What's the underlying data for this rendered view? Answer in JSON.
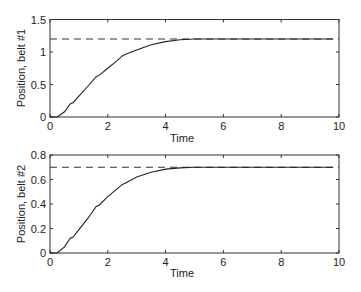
{
  "chart_data": [
    {
      "type": "line",
      "title": "",
      "xlabel": "Time",
      "ylabel": "Position, belt #1",
      "xlim": [
        0,
        10
      ],
      "ylim": [
        0,
        1.5
      ],
      "xticks": [
        "0",
        "2",
        "4",
        "6",
        "8",
        "10"
      ],
      "yticks": [
        "0",
        "0.5",
        "1",
        "1.5"
      ],
      "grid": false,
      "legend": null,
      "series": [
        {
          "name": "response",
          "style": "solid",
          "x": [
            0,
            0.25,
            0.5,
            0.7,
            0.8,
            1.0,
            1.3,
            1.6,
            1.7,
            2.0,
            2.3,
            2.5,
            2.6,
            3.0,
            3.5,
            4.0,
            4.5,
            5.0,
            6.0,
            7.0,
            8.0,
            9.0,
            9.8
          ],
          "y": [
            0,
            0,
            0.08,
            0.2,
            0.22,
            0.32,
            0.47,
            0.62,
            0.64,
            0.75,
            0.86,
            0.94,
            0.96,
            1.03,
            1.11,
            1.16,
            1.19,
            1.2,
            1.2,
            1.2,
            1.2,
            1.2,
            1.2
          ]
        },
        {
          "name": "reference",
          "style": "dashed",
          "x": [
            0,
            10
          ],
          "y": [
            1.2,
            1.2
          ]
        }
      ]
    },
    {
      "type": "line",
      "title": "",
      "xlabel": "Time",
      "ylabel": "Position, belt #2",
      "xlim": [
        0,
        10
      ],
      "ylim": [
        0,
        0.8
      ],
      "xticks": [
        "0",
        "2",
        "4",
        "6",
        "8",
        "10"
      ],
      "yticks": [
        "0",
        "0.2",
        "0.4",
        "0.6",
        "0.8"
      ],
      "grid": false,
      "legend": null,
      "series": [
        {
          "name": "response",
          "style": "solid",
          "x": [
            0,
            0.25,
            0.5,
            0.7,
            0.8,
            1.0,
            1.3,
            1.6,
            1.7,
            2.0,
            2.3,
            2.5,
            2.6,
            3.0,
            3.5,
            4.0,
            4.5,
            5.0,
            6.0,
            7.0,
            8.0,
            9.0,
            9.8
          ],
          "y": [
            0,
            0,
            0.05,
            0.12,
            0.13,
            0.19,
            0.28,
            0.38,
            0.39,
            0.46,
            0.52,
            0.56,
            0.57,
            0.62,
            0.66,
            0.685,
            0.695,
            0.7,
            0.7,
            0.7,
            0.7,
            0.7,
            0.7
          ]
        },
        {
          "name": "reference",
          "style": "dashed",
          "x": [
            0,
            10
          ],
          "y": [
            0.7,
            0.7
          ]
        }
      ]
    }
  ],
  "plots": [
    {
      "ylabel": "Position, belt #1",
      "xlabel": "Time",
      "xticks": [
        "0",
        "2",
        "4",
        "6",
        "8",
        "10"
      ],
      "yticks": [
        "0",
        "0.5",
        "1",
        "1.5"
      ]
    },
    {
      "ylabel": "Position, belt #2",
      "xlabel": "Time",
      "xticks": [
        "0",
        "2",
        "4",
        "6",
        "8",
        "10"
      ],
      "yticks": [
        "0",
        "0.2",
        "0.4",
        "0.6",
        "0.8"
      ]
    }
  ]
}
